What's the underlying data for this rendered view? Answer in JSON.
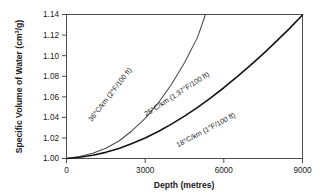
{
  "chart_data": {
    "type": "line",
    "title": "",
    "xlabel": "Depth (metres)",
    "ylabel": "Specific Volume of Water (cm³/g)",
    "xlim": [
      0,
      9000
    ],
    "ylim": [
      1.0,
      1.14
    ],
    "grid": false,
    "legend_position": "inline-curve-labels",
    "xticks": [
      "0",
      "3000",
      "6000",
      "9000"
    ],
    "xtick_values": [
      0,
      3000,
      6000,
      9000
    ],
    "yticks": [
      "1.00",
      "1.02",
      "1.04",
      "1.06",
      "1.08",
      "1.10",
      "1.12",
      "1.14"
    ],
    "ytick_values": [
      1.0,
      1.02,
      1.04,
      1.06,
      1.08,
      1.1,
      1.12,
      1.14
    ],
    "series": [
      {
        "name": "36°C/km (2°F/100 ft)",
        "style": "thin",
        "x": [
          0,
          500,
          1000,
          1500,
          2000,
          2500,
          3000,
          3500,
          4000,
          4500,
          5000,
          5300
        ],
        "values": [
          1.0,
          1.002,
          1.005,
          1.01,
          1.017,
          1.027,
          1.039,
          1.054,
          1.072,
          1.093,
          1.118,
          1.14
        ]
      },
      {
        "name": "25°C/km (1.37°F/100 ft)",
        "style": "thick",
        "x": [
          0,
          500,
          1000,
          1500,
          2000,
          2500,
          3000,
          3500,
          4000,
          4500,
          5000,
          5500,
          6000,
          6500,
          7000,
          7500,
          8000,
          8500,
          9000
        ],
        "values": [
          1.0,
          1.0012,
          1.0032,
          1.006,
          1.0098,
          1.0145,
          1.02,
          1.0263,
          1.0334,
          1.0412,
          1.0497,
          1.0589,
          1.0688,
          1.0793,
          1.0903,
          1.1018,
          1.1138,
          1.1263,
          1.1395
        ]
      }
    ],
    "annotations": [
      {
        "id": "label-36",
        "text": "36°C/km (2°F/100 ft)",
        "x": 112,
        "y": 96,
        "rotation": -52
      },
      {
        "id": "label-25",
        "text": "25°C/km (1.37°F/100 ft)",
        "x": 178,
        "y": 96,
        "rotation": -33
      },
      {
        "id": "label-18",
        "text": "18°C/km (1°F/100 ft)",
        "x": 207,
        "y": 132,
        "rotation": -28
      }
    ]
  },
  "axes": {
    "x_title": "Depth (metres)",
    "y_title": "Specific Volume of Water (cm³/g)",
    "y_title_main": "Specific Volume of Water (cm",
    "y_title_sup": "3",
    "y_title_tail": "/g)"
  },
  "ticks": {
    "x": [
      "0",
      "3000",
      "6000",
      "9000"
    ],
    "y": [
      "1.00",
      "1.02",
      "1.04",
      "1.06",
      "1.08",
      "1.10",
      "1.12",
      "1.14"
    ]
  },
  "labels": {
    "curve_36": "36°C/km (2°F/100 ft)",
    "curve_25": "25°C/km (1.37°F/100 ft)",
    "curve_18": "18°C/km (1°F/100 ft)"
  },
  "colors": {
    "background": "#ffffff",
    "frame": "#4d4d4d",
    "curve_thin": "#4a4a4a",
    "curve_thick": "#161616",
    "text": "#1a1a1a"
  }
}
